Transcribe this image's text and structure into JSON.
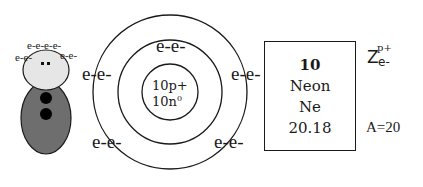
{
  "figure": {
    "head_electrons": {
      "top": "e-e-e-e-",
      "left": "e-e-",
      "right": "e-e-"
    },
    "colors": {
      "head": "#e6e6e6",
      "body": "#6e6e6e",
      "dots": "#000000"
    }
  },
  "bohr_model": {
    "nucleus": {
      "protons": "10p+",
      "neutrons": "10n",
      "neutron_sup": "0"
    },
    "electrons": {
      "inner_top": "e-e-",
      "inner_left": "e-e-",
      "inner_right": "e-e-",
      "outer_bottom_left": "e-e-",
      "outer_bottom_right": "e-e-"
    }
  },
  "element_card": {
    "atomic_number": "10",
    "name": "Neon",
    "symbol": "Ne",
    "atomic_mass": "20.18"
  },
  "legend": {
    "z_label": "Z",
    "z_sup": "p+",
    "z_sub": "e-",
    "mass_number": "A=20"
  }
}
